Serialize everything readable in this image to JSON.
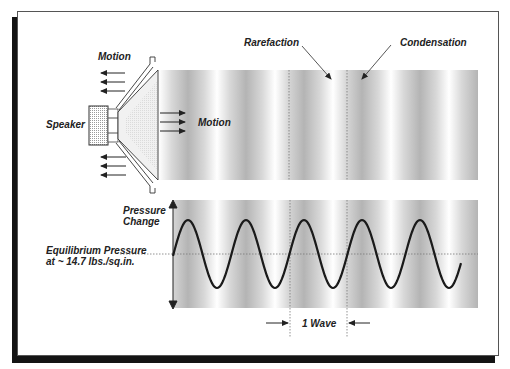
{
  "labels": {
    "motion_top": "Motion",
    "motion_right": "Motion",
    "speaker": "Speaker",
    "rarefaction": "Rarefaction",
    "condensation": "Condensation",
    "pressure_change_1": "Pressure",
    "pressure_change_2": "Change",
    "equilibrium_1": "Equilibrium Pressure",
    "equilibrium_2": "at ~ 14.7 lbs./sq.in.",
    "one_wave": "1 Wave"
  },
  "colors": {
    "ink": "#222222",
    "shadow": "#141414",
    "band_dark": "#b8b8b8",
    "band_light": "#ffffff"
  },
  "wave": {
    "start_x": 173,
    "end_x": 461,
    "center_y": 254,
    "amplitude": 34,
    "period_px": 58,
    "first_peak_x": 188
  }
}
